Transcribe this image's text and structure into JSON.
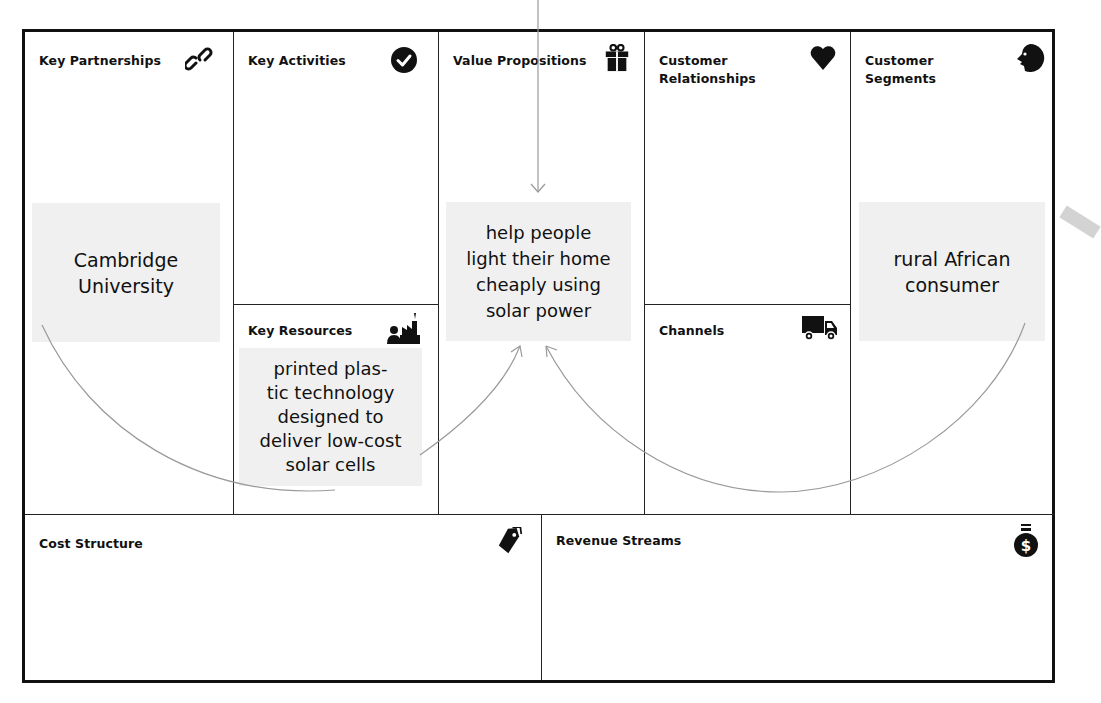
{
  "canvas": {
    "blocks": {
      "key_partnerships": {
        "title": "Key Partnerships",
        "icon": "link-icon"
      },
      "key_activities": {
        "title": "Key Activities",
        "icon": "checkmark-circle-icon"
      },
      "key_resources": {
        "title": "Key Resources",
        "icon": "factory-worker-icon"
      },
      "value_propositions": {
        "title": "Value Propositions",
        "icon": "gift-icon"
      },
      "customer_relationships": {
        "title": "Customer Relationships",
        "title_lines": [
          "Customer",
          "Relationships"
        ],
        "icon": "heart-icon"
      },
      "channels": {
        "title": "Channels",
        "icon": "truck-icon"
      },
      "customer_segments": {
        "title": "Customer Segments",
        "title_lines": [
          "Customer",
          "Segments"
        ],
        "icon": "face-profile-icon"
      },
      "cost_structure": {
        "title": "Cost Structure",
        "icon": "price-tag-icon"
      },
      "revenue_streams": {
        "title": "Revenue Streams",
        "icon": "money-bag-icon"
      }
    },
    "notes": {
      "partner": "Cambridge University",
      "resource": "printed plas- tic technology designed to deliver low-cost solar cells",
      "resource_lines": [
        "printed plas-",
        "tic technology",
        "designed to",
        "deliver low-cost",
        "solar cells"
      ],
      "value": "help people light their home cheaply using solar power",
      "value_lines": [
        "help people",
        "light their home",
        "cheaply using",
        "solar power"
      ],
      "segment": "rural African consumer",
      "segment_lines": [
        "rural African",
        "consumer"
      ],
      "partner_lines": [
        "Cambridge",
        "University"
      ]
    },
    "colors": {
      "border": "#111111",
      "note_bg": "#f0f0f0",
      "arrow": "#9a9a9a"
    }
  }
}
